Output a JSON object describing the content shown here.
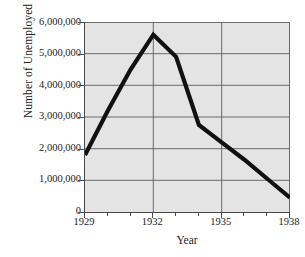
{
  "chart_data": {
    "type": "line",
    "title": "",
    "xlabel": "Year",
    "ylabel": "Number of Unemployed",
    "xlim": [
      1929,
      1938
    ],
    "ylim": [
      0,
      6000000
    ],
    "grid": "horizontal-every-1000000-and-vertical-at-1932-1935",
    "legend": "none",
    "x": [
      1929,
      1930,
      1931,
      1932,
      1933,
      1934,
      1935,
      1936,
      1937,
      1938
    ],
    "values": [
      1800000,
      3200000,
      4500000,
      5600000,
      4900000,
      2750000,
      2200000,
      1650000,
      1050000,
      450000
    ],
    "series": [
      {
        "name": "Number of Unemployed",
        "color": "#111111",
        "values": [
          1800000,
          3200000,
          4500000,
          5600000,
          4900000,
          2750000,
          2200000,
          1650000,
          1050000,
          450000
        ]
      }
    ],
    "x_tick_labels": [
      "1929",
      "1932",
      "1935",
      "1938"
    ],
    "x_tick_values": [
      1929,
      1932,
      1935,
      1938
    ],
    "x_minor_ticks": [
      1930,
      1931,
      1933,
      1934,
      1936,
      1937
    ],
    "y_tick_labels": [
      "6,000,000",
      "5,000,000",
      "4,000,000",
      "3,000,000",
      "2,000,000",
      "1,000,000",
      "0"
    ],
    "y_tick_values": [
      6000000,
      5000000,
      4000000,
      3000000,
      2000000,
      1000000,
      0
    ],
    "plot_background": "#e4e4e4",
    "gridline_color": "#6b6b6b",
    "axis_color": "#4a4a4a"
  }
}
